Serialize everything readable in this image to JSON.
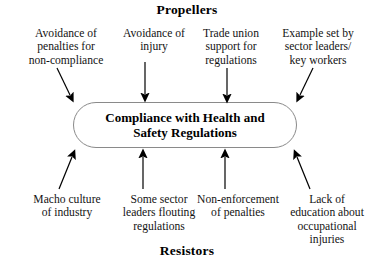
{
  "diagram": {
    "title_top": "Propellers",
    "title_bottom": "Resistors",
    "center": {
      "label": "Compliance with Health and\nSafety Regulations",
      "shape": "rounded-rectangle",
      "border_color": "#8a8a8a",
      "fill_color": "#ffffff"
    },
    "propellers": [
      {
        "label": "Avoidance of\npenalties for\nnon-compliance",
        "arrow": "down-right"
      },
      {
        "label": "Avoidance of\ninjury",
        "arrow": "down"
      },
      {
        "label": "Trade union\nsupport for\nregulations",
        "arrow": "down"
      },
      {
        "label": "Example set by\nsector leaders/\nkey workers",
        "arrow": "down-left"
      }
    ],
    "resistors": [
      {
        "label": "Macho culture\nof industry",
        "arrow": "up-right"
      },
      {
        "label": "Some sector\nleaders flouting\nregulations",
        "arrow": "up"
      },
      {
        "label": "Non-enforcement\nof penalties",
        "arrow": "up"
      },
      {
        "label": "Lack of\neducation about\noccupational\ninjuries",
        "arrow": "up-left"
      }
    ],
    "arrow_color": "#000000"
  }
}
